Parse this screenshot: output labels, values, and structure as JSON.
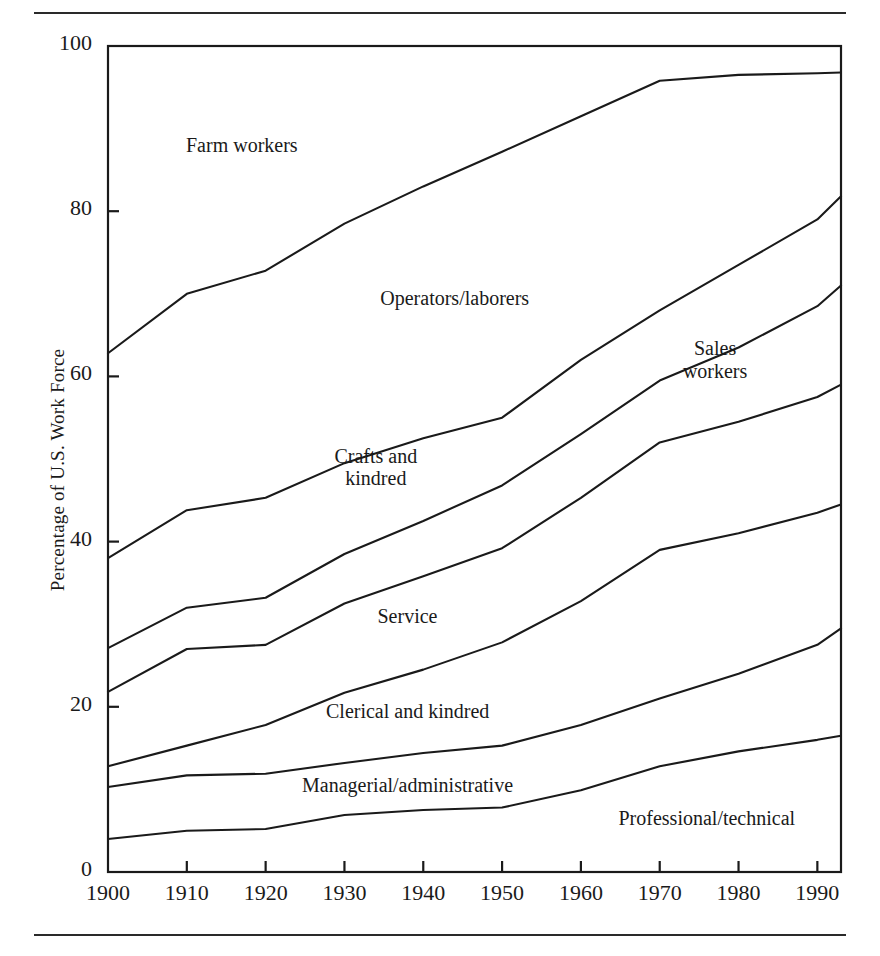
{
  "figure": {
    "has_top_rule": true,
    "has_bottom_rule": true,
    "ink_color": "#1a1a1a"
  },
  "chart_data": {
    "type": "area",
    "title": "",
    "subtitle": "",
    "xlabel": "",
    "ylabel": "Percentage of U.S. Work Force",
    "x": [
      1900,
      1910,
      1920,
      1930,
      1940,
      1950,
      1960,
      1970,
      1980,
      1990,
      1993
    ],
    "xlim": [
      1900,
      1993
    ],
    "ylim": [
      0,
      100
    ],
    "grid": false,
    "legend_position": "inline-annotations",
    "xticks": [
      1900,
      1910,
      1920,
      1930,
      1940,
      1950,
      1960,
      1970,
      1980,
      1990
    ],
    "xtick_labels": [
      "1900",
      "1910",
      "1920",
      "1930",
      "1940",
      "1950",
      "1960",
      "1970",
      "1980",
      "1990"
    ],
    "yticks": [
      0,
      20,
      40,
      60,
      80,
      100
    ],
    "ytick_labels": [
      "0",
      "20",
      "40",
      "60",
      "80",
      "100"
    ],
    "stacking": "cumulative-from-bottom",
    "series": [
      {
        "name": "Professional/technical",
        "label": "Professional/technical",
        "label_x": 1976,
        "label_y": 6.5,
        "cumulative_top": [
          4.0,
          5.0,
          5.2,
          6.9,
          7.5,
          7.8,
          9.9,
          12.8,
          14.6,
          16.0,
          16.5
        ]
      },
      {
        "name": "Managerial/administrative",
        "label": "Managerial/administrative",
        "label_x": 1938,
        "label_y": 10.5,
        "cumulative_top": [
          10.3,
          11.7,
          11.9,
          13.2,
          14.4,
          15.3,
          17.8,
          21.0,
          24.0,
          27.5,
          29.5
        ]
      },
      {
        "name": "Clerical and kindred",
        "label": "Clerical and kindred",
        "label_x": 1938,
        "label_y": 19.5,
        "cumulative_top": [
          12.8,
          15.3,
          17.8,
          21.7,
          24.5,
          27.8,
          32.8,
          39.0,
          41.0,
          43.5,
          44.5
        ]
      },
      {
        "name": "Service",
        "label": "Service",
        "label_x": 1938,
        "label_y": 31.0,
        "cumulative_top": [
          21.8,
          27.0,
          27.5,
          32.5,
          35.8,
          39.2,
          45.3,
          52.0,
          54.5,
          57.5,
          59.0
        ]
      },
      {
        "name": "Sales workers",
        "label": "Sales\nworkers",
        "label_x": 1977,
        "label_y": 62.0,
        "cumulative_top": [
          27.1,
          32.0,
          33.2,
          38.5,
          42.5,
          46.8,
          53.0,
          59.5,
          63.5,
          68.5,
          71.0
        ]
      },
      {
        "name": "Crafts and kindred",
        "label": "Crafts and\nkindred",
        "label_x": 1934,
        "label_y": 49.0,
        "cumulative_top": [
          38.0,
          43.8,
          45.3,
          49.5,
          52.5,
          55.0,
          62.0,
          68.0,
          73.5,
          79.0,
          81.8
        ]
      },
      {
        "name": "Operators/laborers",
        "label": "Operators/laborers",
        "label_x": 1944,
        "label_y": 69.5,
        "cumulative_top": [
          62.8,
          70.0,
          72.8,
          78.5,
          83.0,
          87.2,
          91.5,
          95.8,
          96.5,
          96.7,
          96.8
        ]
      },
      {
        "name": "Farm workers",
        "label": "Farm workers",
        "label_x": 1917,
        "label_y": 88.0,
        "cumulative_top": [
          100,
          100,
          100,
          100,
          100,
          100,
          100,
          100,
          100,
          100,
          100
        ]
      }
    ]
  }
}
